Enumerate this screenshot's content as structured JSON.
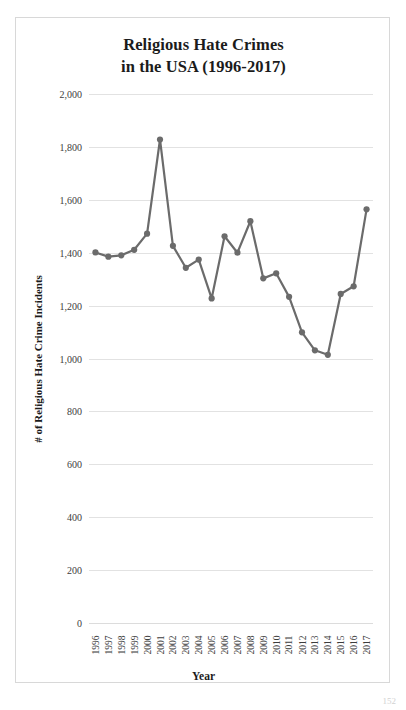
{
  "page": {
    "page_number": "152"
  },
  "chart_data": {
    "type": "line",
    "title": "Religious Hate Crimes in the USA (1996-2017)",
    "title_lines": [
      "Religious Hate Crimes",
      "in the USA (1996-2017)"
    ],
    "xlabel": "Year",
    "ylabel": "# of Religious Hate Crime Incidents",
    "categories": [
      "1996",
      "1997",
      "1998",
      "1999",
      "2000",
      "2001",
      "2002",
      "2003",
      "2004",
      "2005",
      "2006",
      "2007",
      "2008",
      "2009",
      "2010",
      "2011",
      "2012",
      "2013",
      "2014",
      "2015",
      "2016",
      "2017"
    ],
    "values": [
      1401,
      1385,
      1390,
      1411,
      1472,
      1828,
      1426,
      1343,
      1374,
      1227,
      1462,
      1400,
      1519,
      1303,
      1322,
      1233,
      1099,
      1031,
      1014,
      1244,
      1273,
      1564
    ],
    "ylim": [
      0,
      2000
    ],
    "ytick_values": [
      0,
      200,
      400,
      600,
      800,
      1000,
      1200,
      1400,
      1600,
      1800,
      2000
    ],
    "ytick_labels": [
      "0",
      "200",
      "400",
      "600",
      "800",
      "1,000",
      "1,200",
      "1,400",
      "1,600",
      "1,800",
      "2,000"
    ],
    "grid": true,
    "legend": "none",
    "series_color": "#6b6b6b",
    "marker": "circle",
    "marker_size": 5,
    "line_width": 2.2
  }
}
